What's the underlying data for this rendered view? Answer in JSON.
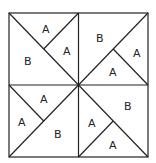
{
  "diagram": {
    "stroke_color": "#222222",
    "background": "#ffffff",
    "quadrants": [
      {
        "position": "top-left",
        "labels": [
          "A",
          "A",
          "B"
        ]
      },
      {
        "position": "top-right",
        "labels": [
          "B",
          "A",
          "A"
        ]
      },
      {
        "position": "bottom-left",
        "labels": [
          "A",
          "A",
          "B"
        ]
      },
      {
        "position": "bottom-right",
        "labels": [
          "B",
          "A",
          "A"
        ]
      }
    ]
  }
}
